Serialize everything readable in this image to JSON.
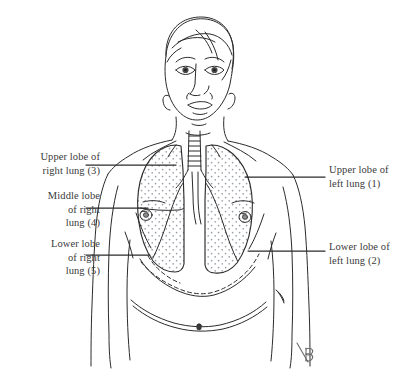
{
  "figure": {
    "background_color": "#ffffff",
    "ink_color": "#2b2b2b",
    "label_color": "#3a3a3a",
    "stipple_color": "#9aa0a8",
    "signature": "B"
  },
  "labels": {
    "upper_right_lung": "Upper lobe of\nright lung (3)",
    "middle_right_lung": "Middle lobe\nof right\nlung (4)",
    "lower_right_lung": "Lower lobe\nof right\nlung (5)",
    "upper_left_lung": "Upper lobe of\nleft lung (1)",
    "lower_left_lung": "Lower lobe of\nleft lung (2)"
  },
  "numbering": {
    "upper_lobe_left_lung": 1,
    "lower_lobe_left_lung": 2,
    "upper_lobe_right_lung": 3,
    "middle_lobe_right_lung": 4,
    "lower_lobe_right_lung": 5
  },
  "leader_lines": [
    {
      "name": "leader-upper-right-lung",
      "x1": 86,
      "y1": 165,
      "x2": 176,
      "y2": 165
    },
    {
      "name": "leader-middle-right-lung",
      "x1": 86,
      "y1": 208,
      "x2": 148,
      "y2": 208
    },
    {
      "name": "leader-lower-right-lung",
      "x1": 86,
      "y1": 255,
      "x2": 150,
      "y2": 255
    },
    {
      "name": "leader-upper-left-lung",
      "x1": 245,
      "y1": 177,
      "x2": 325,
      "y2": 177
    },
    {
      "name": "leader-lower-left-lung",
      "x1": 248,
      "y1": 251,
      "x2": 325,
      "y2": 251
    }
  ]
}
